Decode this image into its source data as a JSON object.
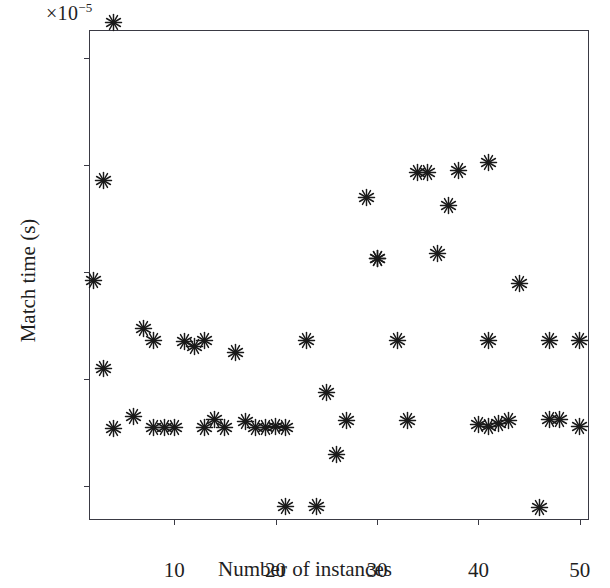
{
  "chart_data": {
    "type": "scatter",
    "title": "",
    "xlabel": "Number of instances",
    "ylabel": "Match time (s)",
    "y_exponent_label": "×10",
    "y_exponent_sup": "−5",
    "y_scale_factor": "1e-5",
    "xlim": [
      1.7,
      51.0
    ],
    "ylim": [
      1.35,
      10.5
    ],
    "xticks": [
      10,
      20,
      30,
      40,
      50
    ],
    "yticks": [
      2,
      4,
      6,
      8,
      10
    ],
    "xtick_labels": [
      "10",
      "20",
      "30",
      "40",
      "50"
    ],
    "ytick_labels": [
      "2",
      "4",
      "6",
      "8",
      "10"
    ],
    "grid": false,
    "legend": false,
    "marker": "asterisk",
    "marker_color": "#1a1a1a",
    "x": [
      2,
      3,
      4,
      5,
      6,
      7,
      8,
      9,
      10,
      11,
      12,
      13,
      14,
      15,
      16,
      17,
      18,
      19,
      20,
      21,
      22,
      23,
      24,
      25,
      26,
      27,
      28,
      29,
      30,
      31,
      32,
      33,
      34,
      35,
      36,
      37,
      38,
      39,
      40,
      41,
      42,
      43,
      44,
      45,
      46,
      47,
      48,
      49,
      50,
      51
    ],
    "y": [
      5.85,
      4.2,
      3.08,
      10.65,
      3.3,
      4.95,
      4.72,
      3.1,
      3.1,
      4.7,
      4.6,
      4.72,
      3.1,
      3.25,
      4.5,
      3.2,
      3.1,
      3.1,
      3.12,
      1.62,
      3.1,
      4.72,
      1.62,
      3.75,
      2.6,
      3.22,
      7.4,
      6.25,
      6.25,
      3.2,
      4.72,
      7.85,
      7.85,
      6.35,
      7.25,
      7.9,
      8.05,
      3.15,
      3.12,
      4.72,
      3.18,
      3.22,
      5.78,
      1.6,
      3.25,
      3.25,
      4.72,
      3.12,
      4.72,
      7.7
    ],
    "points": [
      {
        "x": 2,
        "y": 5.85
      },
      {
        "x": 3,
        "y": 4.2
      },
      {
        "x": 4,
        "y": 3.08
      },
      {
        "x": 4,
        "y": 10.65
      },
      {
        "x": 3,
        "y": 7.7
      },
      {
        "x": 6,
        "y": 3.3
      },
      {
        "x": 7,
        "y": 4.95
      },
      {
        "x": 8,
        "y": 4.72
      },
      {
        "x": 8,
        "y": 3.1
      },
      {
        "x": 9,
        "y": 3.1
      },
      {
        "x": 10,
        "y": 3.1
      },
      {
        "x": 11,
        "y": 4.7
      },
      {
        "x": 12,
        "y": 4.6
      },
      {
        "x": 13,
        "y": 4.72
      },
      {
        "x": 13,
        "y": 3.1
      },
      {
        "x": 14,
        "y": 3.25
      },
      {
        "x": 16,
        "y": 4.5
      },
      {
        "x": 15,
        "y": 3.1
      },
      {
        "x": 17,
        "y": 3.2
      },
      {
        "x": 18,
        "y": 3.1
      },
      {
        "x": 19,
        "y": 3.1
      },
      {
        "x": 20,
        "y": 3.12
      },
      {
        "x": 21,
        "y": 1.62
      },
      {
        "x": 21,
        "y": 3.1
      },
      {
        "x": 23,
        "y": 4.72
      },
      {
        "x": 24,
        "y": 1.62
      },
      {
        "x": 25,
        "y": 3.75
      },
      {
        "x": 26,
        "y": 2.6
      },
      {
        "x": 27,
        "y": 3.22
      },
      {
        "x": 29,
        "y": 7.4
      },
      {
        "x": 30,
        "y": 6.25
      },
      {
        "x": 30,
        "y": 6.25
      },
      {
        "x": 32,
        "y": 4.72
      },
      {
        "x": 33,
        "y": 3.22
      },
      {
        "x": 34,
        "y": 7.85
      },
      {
        "x": 35,
        "y": 7.85
      },
      {
        "x": 36,
        "y": 6.35
      },
      {
        "x": 37,
        "y": 7.25
      },
      {
        "x": 38,
        "y": 7.9
      },
      {
        "x": 41,
        "y": 8.05
      },
      {
        "x": 40,
        "y": 3.15
      },
      {
        "x": 41,
        "y": 3.12
      },
      {
        "x": 41,
        "y": 4.72
      },
      {
        "x": 42,
        "y": 3.18
      },
      {
        "x": 43,
        "y": 3.22
      },
      {
        "x": 44,
        "y": 5.78
      },
      {
        "x": 46,
        "y": 1.6
      },
      {
        "x": 47,
        "y": 3.25
      },
      {
        "x": 48,
        "y": 3.25
      },
      {
        "x": 47,
        "y": 4.72
      },
      {
        "x": 50,
        "y": 3.12
      },
      {
        "x": 50,
        "y": 4.72
      }
    ]
  }
}
